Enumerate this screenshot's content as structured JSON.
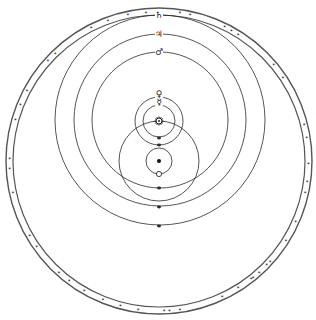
{
  "diagram": {
    "type": "geo-heliocentric cosmological diagram",
    "colors": {
      "background": "#ffffff",
      "ink": "#2a2a2a",
      "ring": "#555555"
    },
    "firmament": {
      "center": [
        159,
        161
      ],
      "outer_radius": 153,
      "inner_radius": 146,
      "star_marks_angles_deg": [
        -95,
        -82,
        -78,
        -64,
        -61,
        -58,
        -40,
        -34,
        -14,
        -9,
        1,
        8,
        12,
        24,
        32,
        42,
        44,
        48,
        51,
        52,
        58,
        65,
        82,
        86,
        88,
        98,
        105,
        112,
        120,
        127,
        132,
        145,
        150,
        168,
        177,
        181,
        196,
        202,
        208,
        222,
        226,
        243,
        250,
        258
      ]
    },
    "earth": {
      "label": "Earth",
      "symbol": "●",
      "position": [
        159,
        161
      ]
    },
    "moon": {
      "label": "Moon",
      "orbit_center": [
        159,
        161
      ],
      "orbit_radius": 13,
      "position": [
        159,
        174
      ]
    },
    "sun": {
      "label": "Sun",
      "symbol": "☉",
      "position": [
        159,
        121
      ],
      "orbit_center": [
        159,
        161
      ],
      "orbit_radius": 40
    },
    "planets": [
      {
        "name": "Mercury",
        "symbol": "☿",
        "orbit_center": [
          159,
          121
        ],
        "orbit_radius": 16,
        "label_pos": [
          159,
          102
        ]
      },
      {
        "name": "Venus",
        "symbol": "♀",
        "orbit_center": [
          159,
          121
        ],
        "orbit_radius": 24,
        "label_pos": [
          159,
          94
        ]
      },
      {
        "name": "Mars",
        "symbol": "♂",
        "orbit_center": [
          160,
          120
        ],
        "orbit_radius": 68,
        "label_pos": [
          159,
          52
        ]
      },
      {
        "name": "Jupiter",
        "symbol": "♃",
        "orbit_center": [
          160,
          120
        ],
        "orbit_radius": 86,
        "label_pos": [
          159,
          34
        ]
      },
      {
        "name": "Saturn",
        "symbol": "♄",
        "orbit_center": [
          160,
          120
        ],
        "orbit_radius": 105,
        "label_pos": [
          159,
          15
        ]
      }
    ],
    "axis_marks_y": [
      138,
      145,
      188,
      207,
      226
    ]
  }
}
